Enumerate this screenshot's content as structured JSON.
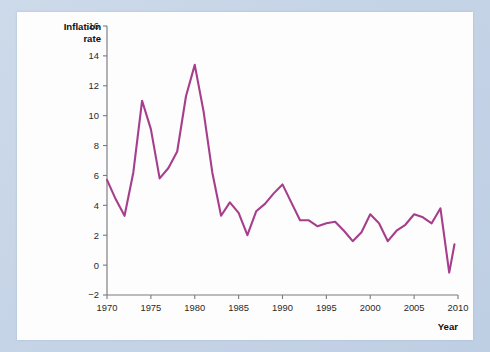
{
  "figure": {
    "y_axis_title_line1": "Inflation",
    "y_axis_title_line2": "rate",
    "x_axis_title": "Year"
  },
  "chart_data": {
    "type": "line",
    "title": "",
    "subtitle": "",
    "xlabel": "Year",
    "ylabel": "Inflation rate",
    "xlim": [
      1970,
      2010
    ],
    "ylim": [
      -2,
      16
    ],
    "grid": false,
    "legend": "none",
    "x_ticks": [
      1970,
      1975,
      1980,
      1985,
      1990,
      1995,
      2000,
      2005,
      2010
    ],
    "x_tick_labels": [
      "1970",
      "1975",
      "1980",
      "1985",
      "1990",
      "1995",
      "2000",
      "2005",
      "2010"
    ],
    "y_ticks": [
      -2,
      0,
      2,
      4,
      6,
      8,
      10,
      12,
      14,
      16
    ],
    "y_tick_labels": [
      "−2",
      "0",
      "2",
      "4",
      "6",
      "8",
      "10",
      "12",
      "14",
      "16"
    ],
    "line_color": "#a63e8c",
    "series": [
      {
        "name": "Inflation rate",
        "color": "#a63e8c",
        "x": [
          1970,
          1971,
          1972,
          1973,
          1974,
          1975,
          1976,
          1977,
          1978,
          1979,
          1980,
          1981,
          1982,
          1983,
          1984,
          1985,
          1986,
          1987,
          1988,
          1989,
          1990,
          1991,
          1992,
          1993,
          1994,
          1995,
          1996,
          1997,
          1998,
          1999,
          2000,
          2001,
          2002,
          2003,
          2004,
          2005,
          2006,
          2007,
          2008,
          2009
        ],
        "values": [
          5.7,
          4.4,
          3.3,
          6.2,
          11.0,
          9.1,
          5.8,
          6.5,
          7.6,
          11.3,
          13.4,
          10.3,
          6.2,
          3.3,
          4.2,
          3.5,
          2.0,
          3.6,
          4.1,
          4.8,
          5.4,
          4.2,
          3.0,
          3.0,
          2.6,
          2.8,
          2.9,
          2.3,
          1.6,
          2.2,
          3.4,
          2.8,
          1.6,
          2.3,
          2.7,
          3.4,
          3.2,
          2.8,
          3.8,
          -0.5
        ],
        "last_point_x": 2009.6,
        "last_point_value": 1.4
      }
    ]
  }
}
